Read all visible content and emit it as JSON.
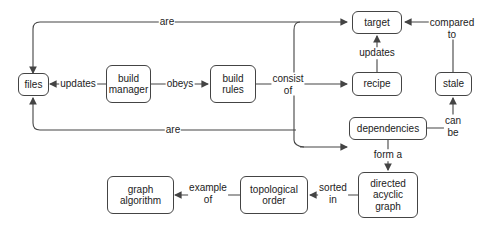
{
  "nodes": {
    "files": "files",
    "build_manager": "build\nmanager",
    "build_rules": "build\nrules",
    "target": "target",
    "recipe": "recipe",
    "stale": "stale",
    "dependencies": "dependencies",
    "dag": "directed\nacyclic\ngraph",
    "topological_order": "topological\norder",
    "graph_algorithm": "graph\nalgorithm"
  },
  "edges": {
    "are_top": "are",
    "updates_files": "updates",
    "obeys": "obeys",
    "consist_of": "consist\nof",
    "updates_target": "updates",
    "compared_to": "compared\nto",
    "can_be": "can\nbe",
    "are_bottom": "are",
    "form_a": "form a",
    "sorted_in": "sorted\nin",
    "example_of": "example\nof"
  },
  "colors": {
    "stroke": "#444444",
    "text": "#222222",
    "background": "#ffffff"
  }
}
